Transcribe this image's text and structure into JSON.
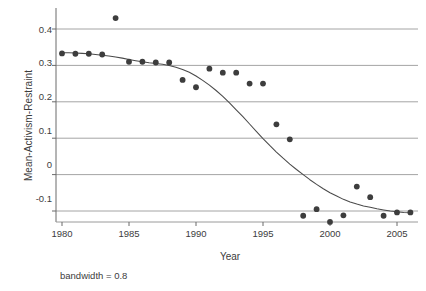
{
  "chart_data": {
    "type": "scatter",
    "title": "",
    "subtitle": "",
    "xlabel": "Year",
    "ylabel": "Mean-Activism-Restraint",
    "annotation": "bandwidth = 0.8",
    "grid": "horizontal",
    "legend": "none",
    "xlim": [
      1979.2,
      2006.6
    ],
    "ylim": [
      -0.155,
      0.452
    ],
    "xticks": [
      1980,
      1985,
      1990,
      1995,
      2000,
      2005
    ],
    "xtick_labels": [
      "1980",
      "1985",
      "1990",
      "1995",
      "2000",
      "2005"
    ],
    "yticks": [
      -0.1,
      0,
      0.1,
      0.2,
      0.3,
      0.4
    ],
    "ytick_labels": [
      "-0.1",
      "0",
      "0.1",
      "0.2",
      "0.3",
      "0.4"
    ],
    "x": [
      1980,
      1981,
      1982,
      1983,
      1984,
      1985,
      1986,
      1987,
      1988,
      1989,
      1990,
      1991,
      1992,
      1993,
      1994,
      1995,
      1996,
      1997,
      1998,
      1999,
      2000,
      2001,
      2002,
      2003,
      2004,
      2005,
      2006
    ],
    "series": [
      {
        "name": "Mean-Activism-Restraint",
        "type": "scatter",
        "marker": "filled-circle",
        "color": "#3d3d3d",
        "values": [
          0.333,
          0.332,
          0.332,
          0.33,
          0.43,
          0.31,
          0.31,
          0.308,
          0.308,
          0.26,
          0.24,
          0.291,
          0.28,
          0.28,
          0.25,
          0.25,
          0.138,
          0.097,
          -0.113,
          -0.095,
          -0.13,
          -0.112,
          -0.033,
          -0.062,
          -0.113,
          -0.104,
          -0.104
        ]
      },
      {
        "name": "loess smooth",
        "type": "line",
        "color": "#4a4a4a",
        "x": [
          1980,
          1980.5,
          1981,
          1981.5,
          1982,
          1982.5,
          1983,
          1983.5,
          1984,
          1984.5,
          1985,
          1985.5,
          1986,
          1986.5,
          1987,
          1987.5,
          1988,
          1988.5,
          1989,
          1989.5,
          1990,
          1990.5,
          1991,
          1991.5,
          1992,
          1992.5,
          1993,
          1993.5,
          1994,
          1994.5,
          1995,
          1995.5,
          1996,
          1996.5,
          1997,
          1997.5,
          1998,
          1998.5,
          1999,
          1999.5,
          2000,
          2000.5,
          2001,
          2001.5,
          2002,
          2002.5,
          2003,
          2003.5,
          2004,
          2004.5,
          2005,
          2005.5,
          2006
        ],
        "values": [
          0.335,
          0.335,
          0.334,
          0.333,
          0.332,
          0.33,
          0.328,
          0.326,
          0.323,
          0.32,
          0.316,
          0.313,
          0.31,
          0.307,
          0.305,
          0.303,
          0.3,
          0.295,
          0.289,
          0.281,
          0.271,
          0.259,
          0.246,
          0.231,
          0.215,
          0.197,
          0.178,
          0.159,
          0.139,
          0.119,
          0.099,
          0.08,
          0.062,
          0.045,
          0.029,
          0.014,
          0.0,
          -0.014,
          -0.027,
          -0.039,
          -0.05,
          -0.059,
          -0.068,
          -0.075,
          -0.081,
          -0.086,
          -0.09,
          -0.094,
          -0.097,
          -0.1,
          -0.102,
          -0.104,
          -0.105
        ]
      }
    ]
  },
  "axes": {
    "y_title": "Mean-Activism-Restraint",
    "x_title": "Year",
    "caption": "bandwidth = 0.8"
  }
}
